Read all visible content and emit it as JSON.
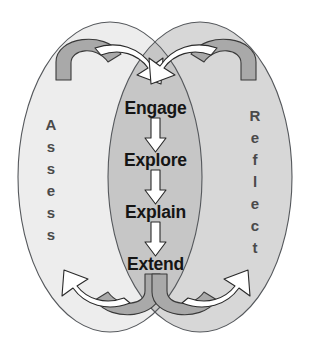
{
  "diagram": {
    "type": "venn-cycle",
    "background_color": "#ffffff",
    "left_ellipse": {
      "label": "Assess",
      "orientation": "vertical",
      "fill_color": "#ededed",
      "stroke_color": "#55585c",
      "letters": [
        "A",
        "s",
        "s",
        "e",
        "s",
        "s"
      ]
    },
    "right_ellipse": {
      "label": "Reflect",
      "orientation": "vertical",
      "fill_color": "#d7d7d7",
      "stroke_color": "#55585c",
      "letters": [
        "R",
        "e",
        "f",
        "l",
        "e",
        "c",
        "t"
      ]
    },
    "overlap": {
      "fill_color": "#c6c6c6",
      "name": "center-overlap-region"
    },
    "phases": [
      {
        "label": "Engage",
        "order": 1
      },
      {
        "label": "Explore",
        "order": 2
      },
      {
        "label": "Explain",
        "order": 3
      },
      {
        "label": "Extend",
        "order": 4
      }
    ],
    "flow_arrows": [
      {
        "from": "Engage",
        "to": "Explore",
        "direction": "down"
      },
      {
        "from": "Explore",
        "to": "Explain",
        "direction": "down"
      },
      {
        "from": "Explain",
        "to": "Extend",
        "direction": "down"
      }
    ],
    "curved_arrows": [
      {
        "name": "top-left-curved-arrow",
        "position": "top-left",
        "direction": "right",
        "fill_color": "#ffffff"
      },
      {
        "name": "top-right-curved-arrow",
        "position": "top-right",
        "direction": "left",
        "fill_color": "#ffffff"
      },
      {
        "name": "bottom-left-curved-arrow",
        "position": "bottom-left",
        "direction": "left",
        "fill_color": "#ffffff"
      },
      {
        "name": "bottom-right-curved-arrow",
        "position": "bottom-right",
        "direction": "right",
        "fill_color": "#ffffff"
      }
    ]
  }
}
